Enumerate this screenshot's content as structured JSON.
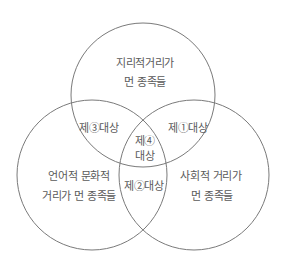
{
  "diagram": {
    "type": "venn-3",
    "stroke_color": "#7a7a7a",
    "text_color": "#5a5a5a",
    "circles": [
      {
        "id": "geographic",
        "cx": 143,
        "cy": 95,
        "r": 72
      },
      {
        "id": "linguistic-cultural",
        "cx": 92,
        "cy": 175,
        "r": 75
      },
      {
        "id": "social",
        "cx": 194,
        "cy": 175,
        "r": 75
      }
    ],
    "sets": {
      "geographic": {
        "line1": "지리적거리가",
        "line2": "먼 종족들"
      },
      "linguistic_cultural": {
        "line1": "언어적 문화적",
        "line2": "거리가 먼 종족들"
      },
      "social": {
        "line1": "사회적 거리가",
        "line2": "먼 종족들"
      }
    },
    "intersections": {
      "target1": "제①대상",
      "target2": "제②대상",
      "target3": "제③대상",
      "target4_line1": "제④",
      "target4_line2": "대상"
    }
  }
}
